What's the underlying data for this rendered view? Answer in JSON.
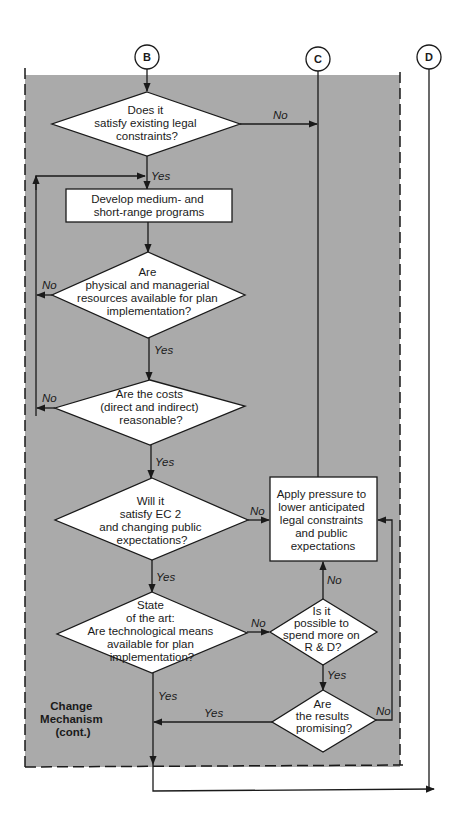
{
  "diagram": {
    "colors": {
      "region_fill": "#aaaaaa",
      "line": "#1a1a1a",
      "node_fill": "#ffffff"
    },
    "connectors": {
      "B": "B",
      "C": "C",
      "D": "D"
    },
    "region_label": [
      "Change",
      "Mechanism",
      "(cont.)"
    ],
    "nodes": {
      "legal": [
        "Does it",
        "satisfy existing legal",
        "constraints?"
      ],
      "develop": [
        "Develop medium- and",
        "short-range programs"
      ],
      "resources": [
        "Are",
        "physical and managerial",
        "resources available for plan",
        "implementation?"
      ],
      "costs": [
        "Are the costs",
        "(direct and indirect)",
        "reasonable?"
      ],
      "ec2": [
        "Will it",
        "satisfy EC 2",
        "and changing public",
        "expectations?"
      ],
      "pressure": [
        "Apply pressure to",
        "lower anticipated",
        "legal constraints",
        "and public",
        "expectations"
      ],
      "state_of_art": [
        "State",
        "of the art:",
        "Are technological means",
        "available for plan",
        "implementation?"
      ],
      "rnd": [
        "Is it",
        "possible to",
        "spend more on",
        "R & D?"
      ],
      "results": [
        "Are",
        "the results",
        "promising?"
      ]
    },
    "edge_labels": {
      "legal_no": "No",
      "legal_yes": "Yes",
      "resources_no": "No",
      "resources_yes": "Yes",
      "costs_no": "No",
      "costs_yes": "Yes",
      "ec2_no": "No",
      "ec2_yes": "Yes",
      "state_no": "No",
      "state_yes": "Yes",
      "rnd_no": "No",
      "rnd_yes": "Yes",
      "results_yes": "Yes",
      "results_no": "No"
    }
  }
}
